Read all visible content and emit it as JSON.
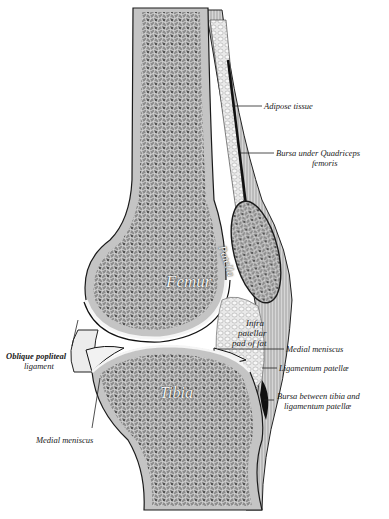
{
  "figure": {
    "in_figure_labels": {
      "femur": "Femur",
      "tibia": "Tibia",
      "patella": "Patella",
      "infrapatellar_pad": [
        "Infra",
        "patellar",
        "pad of fat"
      ]
    },
    "callouts": {
      "adipose_tissue": "Adipose tissue",
      "bursa_quadriceps_line1": "Bursa under Quadriceps",
      "bursa_quadriceps_line2": "femoris",
      "medial_meniscus_right": "Medial meniscus",
      "ligamentum_patellae": "Ligamentum patellæ",
      "bursa_tibia_line1": "Bursa between tibia and",
      "bursa_tibia_line2": "ligamentum patellæ",
      "oblique_popliteal_line1": "Oblique popliteal",
      "oblique_popliteal_line2": "ligament",
      "medial_meniscus_left": "Medial meniscus"
    },
    "colors": {
      "background": "#ffffff",
      "bone_cortex": "#bdbdbd",
      "cancellous": "#7a7a7a",
      "outline": "#1a1a1a",
      "fat": "#e6e6e6"
    }
  }
}
